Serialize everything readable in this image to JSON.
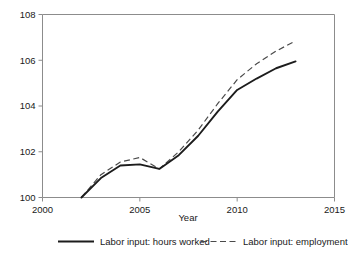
{
  "chart_data": {
    "type": "line",
    "title": "",
    "xlabel": "Year",
    "ylabel": "",
    "xlim": [
      2000,
      2015
    ],
    "ylim": [
      100,
      108
    ],
    "grid": false,
    "legend_position": "bottom",
    "xticks": [
      "2000",
      "2005",
      "2010",
      "2015"
    ],
    "xtick_values": [
      2000,
      2005,
      2010,
      2015
    ],
    "yticks": [
      "100",
      "102",
      "104",
      "106",
      "108"
    ],
    "ytick_values": [
      100,
      102,
      104,
      106,
      108
    ],
    "x": [
      2002,
      2003,
      2004,
      2005,
      2006,
      2007,
      2008,
      2009,
      2010,
      2011,
      2012,
      2013
    ],
    "series": [
      {
        "name": "Labor input: hours worked",
        "style": "solid",
        "color": "#1c1c1c",
        "values": [
          100.0,
          100.85,
          101.4,
          101.45,
          101.25,
          101.85,
          102.7,
          103.75,
          104.7,
          105.2,
          105.65,
          105.95
        ]
      },
      {
        "name": "Labor input: employment",
        "style": "dashed",
        "color": "#4a4a4a",
        "values": [
          100.0,
          101.0,
          101.55,
          101.75,
          101.25,
          102.0,
          102.95,
          104.1,
          105.15,
          105.85,
          106.4,
          106.85
        ]
      }
    ]
  },
  "legend": {
    "items": [
      {
        "label": "Labor input: hours worked",
        "style": "solid"
      },
      {
        "label": "Labor input: employment",
        "style": "dashed"
      }
    ]
  },
  "axes": {
    "x_title": "Year"
  }
}
